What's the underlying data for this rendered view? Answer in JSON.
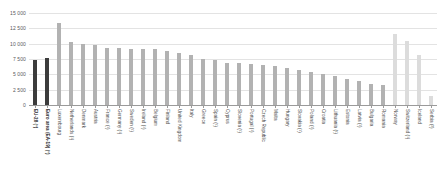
{
  "chart_data": {
    "type": "bar",
    "title": "",
    "subtitle": "",
    "xlabel": "",
    "ylabel": "",
    "ylim": [
      0,
      15000
    ],
    "grid": true,
    "legend": "none",
    "y_ticks": [
      "0",
      "2 500",
      "5 000",
      "7 500",
      "10 000",
      "12 500",
      "15 000"
    ],
    "y_tick_values": [
      0,
      2500,
      5000,
      7500,
      10000,
      12500,
      15000
    ],
    "categories": [
      "EU-28 (¹)",
      "Euro area (EA-19) (¹)",
      "Luxembourg",
      "Netherlands (¹)",
      "Denmark",
      "Austria",
      "France (¹)",
      "Germany (¹)",
      "Sweden (¹)",
      "Ireland (¹)",
      "Belgium",
      "Finland",
      "United Kingdom",
      "Italy",
      "Greece",
      "Spain (¹)",
      "Cyprus",
      "Slovenia (¹)",
      "Portugal (¹)",
      "Czech Republic",
      "Malta",
      "Hungary",
      "Slovakia (¹)",
      "Poland (¹)",
      "Croatia",
      "Lithuania (¹)",
      "Estonia",
      "Latvia (¹)",
      "Bulgaria",
      "Romania",
      "Norway",
      "Switzerland (¹)",
      "Iceland",
      "Serbia (²)"
    ],
    "values": [
      7300,
      7700,
      13400,
      10300,
      9950,
      9800,
      9350,
      9250,
      9200,
      9150,
      9100,
      8850,
      8400,
      8200,
      7500,
      7350,
      6900,
      6800,
      6700,
      6500,
      6300,
      6000,
      5700,
      5450,
      5100,
      4700,
      4300,
      3900,
      3450,
      3250,
      11500,
      10450,
      8150,
      1500
    ],
    "bar_styles": [
      "aggregate",
      "aggregate",
      "member",
      "member",
      "member",
      "member",
      "member",
      "member",
      "member",
      "member",
      "member",
      "member",
      "member",
      "member",
      "member",
      "member",
      "member",
      "member",
      "member",
      "member",
      "member",
      "member",
      "member",
      "member",
      "member",
      "member",
      "member",
      "member",
      "member",
      "member",
      "nonmember",
      "nonmember",
      "nonmember",
      "nonmember"
    ],
    "colors": {
      "aggregate": "#3c3c3c",
      "member": "#b2b2b2",
      "nonmember": "#dcdcdc",
      "grid": "#e3e3e3",
      "axis": "#9a9a9a",
      "text": "#4a4a4a",
      "background": "#ffffff"
    }
  }
}
